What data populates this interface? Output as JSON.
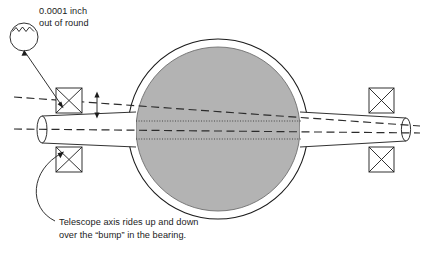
{
  "diagram": {
    "callout": {
      "name": "out-of-round-callout",
      "line1": "0.0001 inch",
      "line2": "out of round"
    },
    "caption": {
      "name": "bearing-bump-caption",
      "line1": "Telescope axis rides up and down",
      "line2": "over the “bump” in the bearing."
    },
    "parts": {
      "detail_circle": "detail-circle",
      "detail_bump_profile": "bump-profile-wave",
      "callout_leader": "callout-leader-line",
      "caption_leader": "caption-leader-line",
      "tube_outer_circle": "telescope-tube-outer-circle",
      "tube_inner_circle": "telescope-tube-inner-circle",
      "tube_fill": "telescope-tube-body",
      "shaft_left": "shaft-left-section",
      "shaft_right": "shaft-right-section",
      "shaft_left_end_cap": "shaft-left-end-cap",
      "shaft_right_end_cap": "shaft-right-end-cap",
      "bearing_upper_left": "bearing-upper-left",
      "bearing_lower_left": "bearing-lower-left",
      "bearing_upper_right": "bearing-upper-right",
      "bearing_lower_right": "bearing-lower-right",
      "axis_line_upper": "axis-line-upper-dashed",
      "axis_line_lower": "axis-line-lower-dashed",
      "hidden_line_upper": "hidden-edge-upper-dotted",
      "hidden_line_lower": "hidden-edge-lower-dotted",
      "dimension_arrow": "runout-dimension-arrow"
    },
    "colors": {
      "stroke": "#1b1b1b",
      "tube_fill": "#b3b3b3",
      "tube_ring": "#ffffff",
      "background": "#ffffff",
      "dash_line": "#2b2b2b",
      "dot_line": "#3a3a3a"
    }
  }
}
